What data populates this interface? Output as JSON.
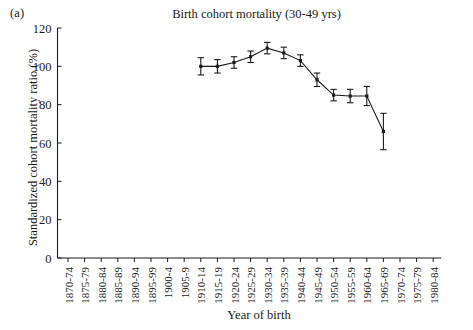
{
  "panel_label": "(a)",
  "axis": {
    "ylabel": "Standardized cohort mortality ratio (%)",
    "xlabel": "Year of birth"
  },
  "chart_data": {
    "type": "line",
    "title": "Birth cohort mortality (30-49 yrs)",
    "xlabel": "Year of birth",
    "ylabel": "Standardized cohort mortality ratio (%)",
    "ylim": [
      0,
      120
    ],
    "yticks": [
      0,
      20,
      40,
      60,
      80,
      100,
      120
    ],
    "grid": false,
    "legend": "none",
    "categories": [
      "1870-74",
      "1875-79",
      "1880-84",
      "1885-89",
      "1890-94",
      "1895-99",
      "1900-4",
      "1905-9",
      "1910-14",
      "1915-19",
      "1920-24",
      "1925-29",
      "1930-34",
      "1935-39",
      "1940-44",
      "1945-49",
      "1950-54",
      "1955-59",
      "1960-64",
      "1965-69",
      "1970-74",
      "1975-79",
      "1980-84"
    ],
    "series": [
      {
        "name": "Standardized cohort mortality ratio",
        "values": [
          null,
          null,
          null,
          null,
          null,
          null,
          null,
          null,
          100.0,
          100.0,
          102.0,
          105.0,
          109.5,
          107.0,
          103.0,
          93.0,
          85.0,
          84.5,
          84.5,
          66.0,
          null,
          null,
          null
        ],
        "errors": [
          null,
          null,
          null,
          null,
          null,
          null,
          null,
          null,
          4.5,
          3.5,
          3.0,
          3.0,
          3.0,
          3.0,
          3.0,
          3.5,
          3.0,
          3.5,
          5.0,
          9.5,
          null,
          null,
          null
        ]
      }
    ],
    "annotations": [
      "(a)"
    ]
  }
}
